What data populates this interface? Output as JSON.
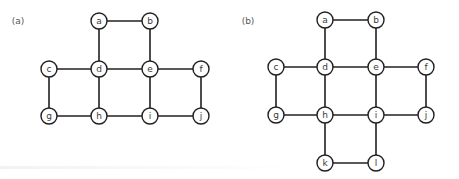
{
  "colors": {
    "stroke": "#231f20",
    "node_fill": "#ffffff",
    "text": "#3a3a3a"
  },
  "node_radius": 8,
  "graphs": [
    {
      "label": "(a)",
      "label_pos": [
        18,
        21
      ],
      "nodes": [
        {
          "id": "a",
          "x": 99,
          "y": 21
        },
        {
          "id": "b",
          "x": 150,
          "y": 21
        },
        {
          "id": "c",
          "x": 49,
          "y": 69
        },
        {
          "id": "d",
          "x": 99,
          "y": 69
        },
        {
          "id": "e",
          "x": 150,
          "y": 69
        },
        {
          "id": "f",
          "x": 201,
          "y": 69
        },
        {
          "id": "g",
          "x": 49,
          "y": 116
        },
        {
          "id": "h",
          "x": 99,
          "y": 116
        },
        {
          "id": "i",
          "x": 150,
          "y": 116
        },
        {
          "id": "j",
          "x": 201,
          "y": 116
        }
      ],
      "edges": [
        [
          "a",
          "b"
        ],
        [
          "a",
          "d"
        ],
        [
          "b",
          "e"
        ],
        [
          "c",
          "d"
        ],
        [
          "d",
          "e"
        ],
        [
          "e",
          "f"
        ],
        [
          "c",
          "g"
        ],
        [
          "d",
          "h"
        ],
        [
          "e",
          "i"
        ],
        [
          "f",
          "j"
        ],
        [
          "g",
          "h"
        ],
        [
          "h",
          "i"
        ],
        [
          "i",
          "j"
        ]
      ]
    },
    {
      "label": "(b)",
      "label_pos": [
        248,
        21
      ],
      "nodes": [
        {
          "id": "a",
          "x": 325,
          "y": 20
        },
        {
          "id": "b",
          "x": 376,
          "y": 20
        },
        {
          "id": "c",
          "x": 276,
          "y": 67
        },
        {
          "id": "d",
          "x": 325,
          "y": 67
        },
        {
          "id": "e",
          "x": 376,
          "y": 67
        },
        {
          "id": "f",
          "x": 426,
          "y": 67
        },
        {
          "id": "g",
          "x": 276,
          "y": 115
        },
        {
          "id": "h",
          "x": 325,
          "y": 115
        },
        {
          "id": "i",
          "x": 376,
          "y": 115
        },
        {
          "id": "j",
          "x": 426,
          "y": 115
        },
        {
          "id": "k",
          "x": 325,
          "y": 163
        },
        {
          "id": "l",
          "x": 376,
          "y": 163
        }
      ],
      "edges": [
        [
          "a",
          "b"
        ],
        [
          "a",
          "d"
        ],
        [
          "b",
          "e"
        ],
        [
          "c",
          "d"
        ],
        [
          "d",
          "e"
        ],
        [
          "e",
          "f"
        ],
        [
          "c",
          "g"
        ],
        [
          "d",
          "h"
        ],
        [
          "e",
          "i"
        ],
        [
          "f",
          "j"
        ],
        [
          "g",
          "h"
        ],
        [
          "h",
          "i"
        ],
        [
          "i",
          "j"
        ],
        [
          "h",
          "k"
        ],
        [
          "i",
          "l"
        ],
        [
          "k",
          "l"
        ]
      ]
    }
  ]
}
